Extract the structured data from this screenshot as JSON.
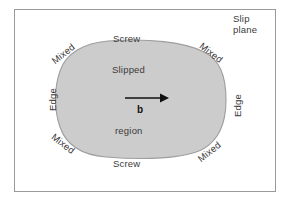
{
  "figure": {
    "type": "dislocation-loop-diagram",
    "frame": {
      "border_color": "#9a9a9a",
      "background": "#ffffff"
    },
    "loop": {
      "fill_color": "#cccccc",
      "stroke_color": "#9e9e9e",
      "shape": "rounded-superellipse"
    },
    "labels": {
      "slip_plane": "Slip plane",
      "screw_top": "Screw",
      "screw_bottom": "Screw",
      "edge_left": "Edge",
      "edge_right": "Edge",
      "mixed_top_left": "Mixed",
      "mixed_top_right": "Mixed",
      "mixed_bottom_left": "Mixed",
      "mixed_bottom_right": "Mixed",
      "slipped": "Slipped",
      "region": "region",
      "burgers_vector": "b"
    },
    "caption": ""
  }
}
